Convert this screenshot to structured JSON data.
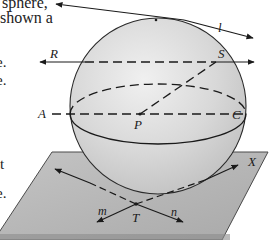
{
  "figure": {
    "type": "sphere-diagram",
    "colors": {
      "sphere_fill": "#d6d6d6",
      "sphere_highlight": "#efefef",
      "plane_fill": "#b9b9b9",
      "plane_edge": "#8a8a8a",
      "line": "#1a1a1a",
      "background": "#ffffff"
    },
    "labels": {
      "l": "l",
      "R": "R",
      "S": "S",
      "A": "A",
      "C": "C",
      "P": "P",
      "T": "T",
      "X": "X",
      "m": "m",
      "n": "n"
    }
  },
  "margin_text": {
    "line1": "sphere,",
    "line2": "shown a",
    "line3": "e.",
    "line4": "e.",
    "line5": "t",
    "line6": "e."
  }
}
